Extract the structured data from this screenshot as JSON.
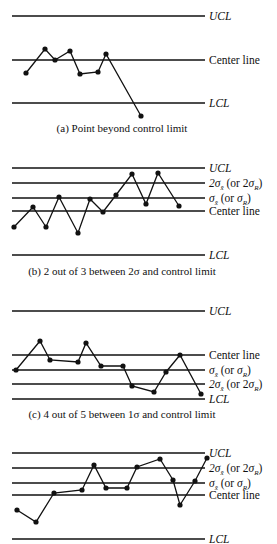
{
  "figure": {
    "panels": [
      {
        "id": "a",
        "caption": "(a)  Point beyond control limit",
        "caption_y": 132,
        "lines": [
          {
            "name": "UCL",
            "label": "UCL",
            "italic": true,
            "y": 16
          },
          {
            "name": "Center line",
            "label": "Center line",
            "italic": false,
            "y": 60
          },
          {
            "name": "LCL",
            "label": "LCL",
            "italic": true,
            "y": 103
          }
        ],
        "points": [
          [
            26,
            73
          ],
          [
            45,
            49
          ],
          [
            55,
            60
          ],
          [
            70,
            51
          ],
          [
            80,
            74
          ],
          [
            98,
            72
          ],
          [
            106,
            54
          ],
          [
            141,
            116
          ]
        ]
      },
      {
        "id": "b",
        "caption": "(b)  2 out of 3 between 2σ and control limit",
        "caption_y": 275,
        "lines": [
          {
            "name": "UCL",
            "label": "UCL",
            "italic": true,
            "y": 168
          },
          {
            "name": "2sigma",
            "label": "2σx̄ (or 2σR)",
            "italic": false,
            "y": 183
          },
          {
            "name": "1sigma",
            "label": "σx̄ (or σR)",
            "italic": false,
            "y": 198
          },
          {
            "name": "Center line",
            "label": "Center line",
            "italic": false,
            "y": 211
          },
          {
            "name": "LCL",
            "label": "LCL",
            "italic": true,
            "y": 255
          }
        ],
        "points": [
          [
            14,
            227
          ],
          [
            33,
            207
          ],
          [
            46,
            227
          ],
          [
            59,
            197
          ],
          [
            78,
            233
          ],
          [
            90,
            199
          ],
          [
            103,
            212
          ],
          [
            116,
            195
          ],
          [
            132,
            174
          ],
          [
            146,
            204
          ],
          [
            158,
            173
          ],
          [
            179,
            206
          ]
        ]
      },
      {
        "id": "c",
        "caption": "(c)  4 out of 5 between 1σ and control limit",
        "caption_y": 418,
        "lines": [
          {
            "name": "UCL",
            "label": "UCL",
            "italic": true,
            "y": 311
          },
          {
            "name": "Center line",
            "label": "Center line",
            "italic": false,
            "y": 355
          },
          {
            "name": "1sigma",
            "label": "σx̄ (or σR)",
            "italic": false,
            "y": 370
          },
          {
            "name": "2sigma",
            "label": "2σx̄ (or 2σR)",
            "italic": false,
            "y": 384
          },
          {
            "name": "LCL",
            "label": "LCL",
            "italic": true,
            "y": 399
          }
        ],
        "points": [
          [
            16,
            370
          ],
          [
            40,
            341
          ],
          [
            50,
            360
          ],
          [
            78,
            362
          ],
          [
            86,
            343
          ],
          [
            101,
            366
          ],
          [
            123,
            366
          ],
          [
            132,
            386
          ],
          [
            154,
            392
          ],
          [
            166,
            372
          ],
          [
            180,
            355
          ],
          [
            201,
            394
          ]
        ]
      },
      {
        "id": "d",
        "caption": "",
        "caption_y": null,
        "lines": [
          {
            "name": "UCL",
            "label": "UCL",
            "italic": true,
            "y": 453
          },
          {
            "name": "2sigma",
            "label": "2σx̄ (or 2σR)",
            "italic": false,
            "y": 468
          },
          {
            "name": "1sigma",
            "label": "σx̄ (or σR)",
            "italic": false,
            "y": 483
          },
          {
            "name": "Center line",
            "label": "Center line",
            "italic": false,
            "y": 495
          },
          {
            "name": "LCL",
            "label": "LCL",
            "italic": true,
            "y": 539
          }
        ],
        "points": [
          [
            17,
            510
          ],
          [
            36,
            522
          ],
          [
            54,
            493
          ],
          [
            82,
            490
          ],
          [
            94,
            465
          ],
          [
            106,
            488
          ],
          [
            127,
            488
          ],
          [
            137,
            467
          ],
          [
            160,
            459
          ],
          [
            173,
            480
          ],
          [
            180,
            505
          ],
          [
            195,
            481
          ],
          [
            207,
            458
          ]
        ]
      }
    ],
    "line_x_start": 12,
    "line_x_end": 205,
    "label_x": 209
  }
}
